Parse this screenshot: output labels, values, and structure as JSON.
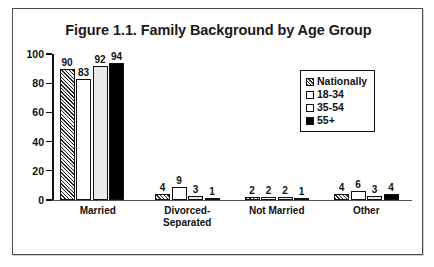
{
  "chart_data": {
    "type": "bar",
    "title": "Figure 1.1. Family Background by Age Group",
    "xlabel": "",
    "ylabel": "",
    "ylim": [
      0,
      100
    ],
    "yticks": [
      0,
      20,
      40,
      60,
      80,
      100
    ],
    "grid": false,
    "legend_position": "upper-right",
    "categories": [
      "Married",
      "Divorced-Separated",
      "Not Married",
      "Other"
    ],
    "category_lines": [
      [
        "Married"
      ],
      [
        "Divorced-",
        "Separated"
      ],
      [
        "Not Married"
      ],
      [
        "Other"
      ]
    ],
    "series": [
      {
        "name": "Nationally",
        "fill": "hatched",
        "values": [
          90,
          4,
          2,
          4
        ]
      },
      {
        "name": "18-34",
        "fill": "white",
        "values": [
          83,
          9,
          2,
          6
        ]
      },
      {
        "name": "35-54",
        "fill": "light-gray",
        "values": [
          92,
          3,
          2,
          3
        ]
      },
      {
        "name": "55+",
        "fill": "black",
        "values": [
          94,
          1,
          1,
          4
        ]
      }
    ]
  },
  "axis": {
    "y_tick_labels": [
      "100",
      "80",
      "60",
      "40",
      "20",
      "0"
    ]
  },
  "legend": {
    "items": [
      {
        "label": "Nationally"
      },
      {
        "label": "18-34"
      },
      {
        "label": "35-54"
      },
      {
        "label": "55+"
      }
    ]
  }
}
